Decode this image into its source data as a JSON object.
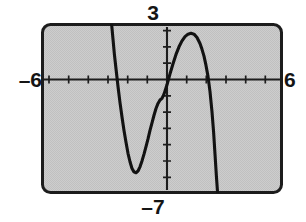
{
  "figure": {
    "kind": "graphing-calculator-screen",
    "screen_bg": "#c9c9c9",
    "frame_color": "#1a1a1a",
    "curve_color": "#121212",
    "axis_color": "#1a1a1a",
    "labels": {
      "top": "3",
      "bottom": "–7",
      "left": "–6",
      "right": "6"
    }
  },
  "chart_data": {
    "type": "line",
    "title": "",
    "xlabel": "",
    "ylabel": "",
    "xlim": [
      -6,
      6
    ],
    "ylim": [
      -7,
      3
    ],
    "grid": false,
    "legend": null,
    "x_tick_step": 1,
    "y_tick_step": 1,
    "x_tick_labels": [
      "-6",
      "6"
    ],
    "y_tick_labels": [
      "3",
      "-7"
    ],
    "annotations": [
      "x-axis drawn with tick marks at every integer from -6 to 6",
      "y-axis drawn with tick marks at every integer from -7 to 3",
      "cubic curve enters window at top-left and exits at bottom-right"
    ],
    "features": {
      "local_minimum": [
        -1.5,
        -5.6
      ],
      "local_maximum": [
        1.5,
        2.4
      ],
      "x_intercepts": [
        -2.35,
        0.3,
        2.35
      ],
      "y_intercept": -1.4,
      "enters_top_at_x": -2.5,
      "exits_bottom_at_x": 2.6
    },
    "series": [
      {
        "name": "curve",
        "points": [
          [
            -2.52,
            3.0
          ],
          [
            -2.45,
            2.1
          ],
          [
            -2.38,
            1.2
          ],
          [
            -2.3,
            0.35
          ],
          [
            -2.2,
            -0.7
          ],
          [
            -2.1,
            -1.65
          ],
          [
            -2.0,
            -2.5
          ],
          [
            -1.9,
            -3.3
          ],
          [
            -1.8,
            -4.0
          ],
          [
            -1.7,
            -4.65
          ],
          [
            -1.6,
            -5.15
          ],
          [
            -1.5,
            -5.55
          ],
          [
            -1.4,
            -5.75
          ],
          [
            -1.3,
            -5.8
          ],
          [
            -1.2,
            -5.7
          ],
          [
            -1.1,
            -5.45
          ],
          [
            -1.0,
            -5.1
          ],
          [
            -0.9,
            -4.7
          ],
          [
            -0.8,
            -4.25
          ],
          [
            -0.7,
            -3.8
          ],
          [
            -0.6,
            -3.3
          ],
          [
            -0.5,
            -2.85
          ],
          [
            -0.4,
            -2.4
          ],
          [
            -0.3,
            -2.0
          ],
          [
            -0.2,
            -1.7
          ],
          [
            -0.1,
            -1.5
          ],
          [
            0.0,
            -1.4
          ],
          [
            0.1,
            -1.15
          ],
          [
            0.25,
            -0.6
          ],
          [
            0.4,
            0.05
          ],
          [
            0.55,
            0.65
          ],
          [
            0.7,
            1.2
          ],
          [
            0.85,
            1.65
          ],
          [
            1.0,
            2.0
          ],
          [
            1.15,
            2.25
          ],
          [
            1.3,
            2.4
          ],
          [
            1.45,
            2.45
          ],
          [
            1.6,
            2.4
          ],
          [
            1.75,
            2.2
          ],
          [
            1.9,
            1.85
          ],
          [
            2.0,
            1.5
          ],
          [
            2.1,
            1.1
          ],
          [
            2.2,
            0.55
          ],
          [
            2.3,
            -0.1
          ],
          [
            2.4,
            -1.0
          ],
          [
            2.5,
            -2.2
          ],
          [
            2.58,
            -3.4
          ],
          [
            2.65,
            -4.7
          ],
          [
            2.72,
            -6.0
          ],
          [
            2.78,
            -7.0
          ]
        ]
      }
    ]
  }
}
